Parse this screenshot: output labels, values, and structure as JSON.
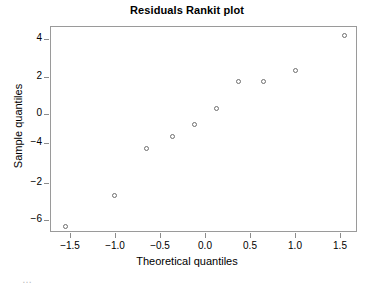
{
  "chart_data": {
    "type": "scatter",
    "title": "Residuals Rankit plot",
    "xlabel": "Theoretical quantiles",
    "ylabel": "Sample quantiles",
    "grid": false,
    "legend": null,
    "xlim": [
      -1.72,
      1.69
    ],
    "xticks": [
      -1.5,
      -1.0,
      -0.5,
      0.0,
      0.5,
      1.0,
      1.5
    ],
    "xticklabels": [
      "−1.5",
      "−1.0",
      "−0.5",
      "0.0",
      "0.5",
      "1.0",
      "1.5"
    ],
    "yticklabels": [
      "4",
      "2",
      "0",
      "−4",
      "−2",
      "−6"
    ],
    "ylim_note": "y tick labels appear in the source image in the non-monotonic order 4, 2, 0, -4, -2, -6 from top to bottom",
    "points": [
      {
        "x": -1.54,
        "y": -6.05
      },
      {
        "x": -1.0,
        "y": -4.4
      },
      {
        "x": -0.64,
        "y": -1.85
      },
      {
        "x": -0.36,
        "y": -1.25
      },
      {
        "x": -0.11,
        "y": -0.6
      },
      {
        "x": 0.13,
        "y": 0.25
      },
      {
        "x": 0.38,
        "y": 1.7
      },
      {
        "x": 0.66,
        "y": 1.7
      },
      {
        "x": 1.01,
        "y": 2.3
      },
      {
        "x": 1.55,
        "y": 4.15
      }
    ],
    "marker": {
      "shape": "circle-open",
      "edge_color": "#6e6e6e",
      "size_px": 5
    }
  },
  "caption": {
    "clipped_text": "…"
  }
}
